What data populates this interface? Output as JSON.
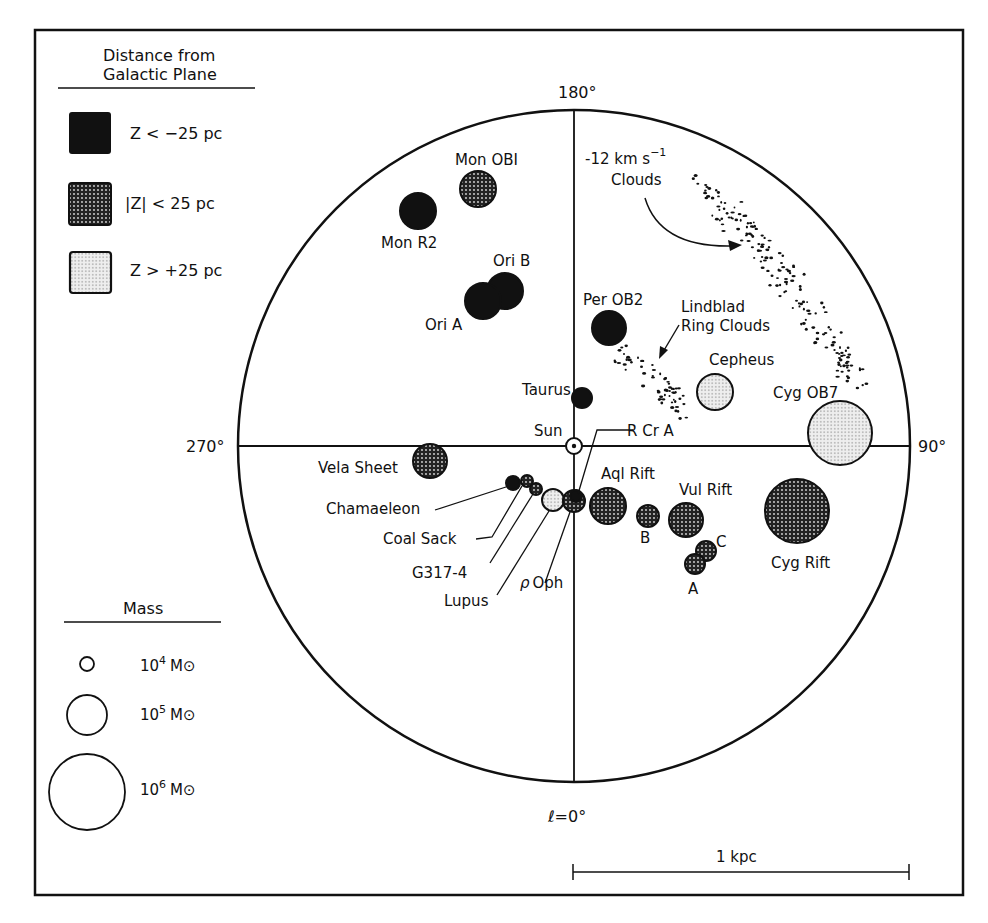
{
  "figure": {
    "type": "Map of local molecular clouds projected on the galactic plane",
    "center_label": "Sun",
    "axis_labels": {
      "top": "180°",
      "left": "270°",
      "right": "90°",
      "bottom": "ℓ=0°"
    },
    "scale_bar": {
      "label": "1 kpc"
    },
    "colors": {
      "ink": "#111111",
      "paper": "#ffffff"
    }
  },
  "legend_distance": {
    "title_line1": "Distance from",
    "title_line2": "Galactic Plane",
    "items": [
      {
        "fill": "solid",
        "label": "Z < −25 pc"
      },
      {
        "fill": "dense-dots",
        "label": "|Z| < 25 pc"
      },
      {
        "fill": "light-dots",
        "label": "Z > +25 pc"
      }
    ]
  },
  "legend_mass": {
    "title": "Mass",
    "items": [
      {
        "label_base": "10",
        "label_exp": "4",
        "label_unit": "M⊙",
        "r": 7
      },
      {
        "label_base": "10",
        "label_exp": "5",
        "label_unit": "M⊙",
        "r": 20
      },
      {
        "label_base": "10",
        "label_exp": "6",
        "label_unit": "M⊙",
        "r": 38
      }
    ]
  },
  "annotations": {
    "velocity_clouds_line1": "-12 km s",
    "velocity_clouds_sup": "−1",
    "velocity_clouds_line2": "Clouds",
    "lindblad_line1": "Lindblad",
    "lindblad_line2": "Ring Clouds"
  },
  "clouds": [
    {
      "name": "Mon OB1",
      "fill": "dense",
      "cx": 478,
      "cy": 189,
      "r": 18
    },
    {
      "name": "Mon R2",
      "fill": "solid",
      "cx": 418,
      "cy": 211,
      "r": 18
    },
    {
      "name": "Ori B",
      "fill": "solid",
      "cx": 505,
      "cy": 291,
      "r": 18
    },
    {
      "name": "Ori A",
      "fill": "solid",
      "cx": 483,
      "cy": 301,
      "r": 18
    },
    {
      "name": "Per OB2",
      "fill": "solid",
      "cx": 609,
      "cy": 328,
      "r": 17
    },
    {
      "name": "Taurus",
      "fill": "solid",
      "cx": 582,
      "cy": 398,
      "r": 10
    },
    {
      "name": "Cepheus",
      "fill": "light",
      "cx": 715,
      "cy": 392,
      "r": 18
    },
    {
      "name": "Cyg OB7",
      "fill": "light",
      "cx": 840,
      "cy": 433,
      "r": 32
    },
    {
      "name": "Vela Sheet",
      "fill": "dense",
      "cx": 430,
      "cy": 461,
      "r": 17
    },
    {
      "name": "Chamaeleon",
      "fill": "solid",
      "cx": 513,
      "cy": 483,
      "r": 7
    },
    {
      "name": "Coal Sack",
      "fill": "dense",
      "cx": 527,
      "cy": 481,
      "r": 6
    },
    {
      "name": "G317-4",
      "fill": "dense",
      "cx": 536,
      "cy": 489,
      "r": 6
    },
    {
      "name": "Lupus",
      "fill": "light",
      "cx": 553,
      "cy": 500,
      "r": 11
    },
    {
      "name": "ρ Oph",
      "fill": "dense",
      "cx": 574,
      "cy": 501,
      "r": 11
    },
    {
      "name": "R Cr A",
      "fill": "solid",
      "cx": 576,
      "cy": 496,
      "r": 6
    },
    {
      "name": "Aql Rift",
      "fill": "dense",
      "cx": 608,
      "cy": 506,
      "r": 18
    },
    {
      "name": "B",
      "fill": "dense",
      "cx": 648,
      "cy": 516,
      "r": 11
    },
    {
      "name": "Vul Rift",
      "fill": "dense",
      "cx": 686,
      "cy": 520,
      "r": 17
    },
    {
      "name": "C",
      "fill": "dense",
      "cx": 706,
      "cy": 551,
      "r": 10
    },
    {
      "name": "A",
      "fill": "dense",
      "cx": 695,
      "cy": 564,
      "r": 10
    },
    {
      "name": "Cyg Rift",
      "fill": "dense",
      "cx": 797,
      "cy": 511,
      "r": 32
    }
  ],
  "labels": {
    "mon_ob1": "Mon OBI",
    "mon_r2": "Mon R2",
    "ori_b": "Ori B",
    "ori_a": "Ori A",
    "per_ob2": "Per OB2",
    "taurus": "Taurus",
    "cepheus": "Cepheus",
    "cyg_ob7": "Cyg OB7",
    "vela": "Vela Sheet",
    "sun": "Sun",
    "rcra": "R Cr A",
    "chamaeleon": "Chamaeleon",
    "coal_sack": "Coal Sack",
    "g317": "G317-4",
    "lupus": "Lupus",
    "rho_oph_rho": "ρ",
    "rho_oph": "Oph",
    "aql_rift": "Aql Rift",
    "b": "B",
    "vul_rift": "Vul Rift",
    "c": "C",
    "a": "A",
    "cyg_rift": "Cyg Rift"
  }
}
